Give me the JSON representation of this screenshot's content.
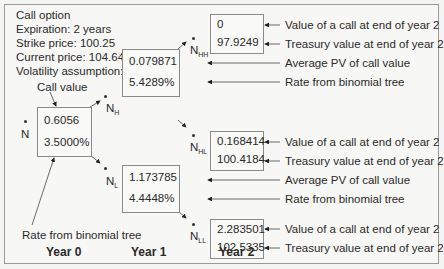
{
  "info": {
    "title": "Call option",
    "expiration": "Expiration: 2 years",
    "strike": "Strike price: 100.25",
    "current": "Current price: 104.643",
    "volatility": "Volatility assumption: 10%"
  },
  "labels": {
    "call_value": "Call value",
    "rate_from_tree": "Rate from binomial tree",
    "value_call_end_y2": "Value of a call at end of year 2",
    "treasury_end_y2": "Treasury value at end of year 2",
    "avg_pv": "Average PV of call value",
    "rate_tree": "Rate from binomial tree"
  },
  "nodes": {
    "N": {
      "label": "N",
      "sub": "",
      "call": "0.6056",
      "rate": "3.5000%"
    },
    "NH": {
      "label": "N",
      "sub": "H",
      "call": "0.079871",
      "rate": "5.4289%"
    },
    "NL": {
      "label": "N",
      "sub": "L",
      "call": "1.173785",
      "rate": "4.4448%"
    },
    "NHH": {
      "label": "N",
      "sub": "HH",
      "call": "0",
      "treasury": "97.9249"
    },
    "NHL": {
      "label": "N",
      "sub": "HL",
      "call": "0.168414",
      "treasury": "100.4184"
    },
    "NLL": {
      "label": "N",
      "sub": "LL",
      "call": "2.283501",
      "treasury": "102.5335"
    }
  },
  "years": [
    "Year 0",
    "Year 1",
    "Year 2"
  ]
}
